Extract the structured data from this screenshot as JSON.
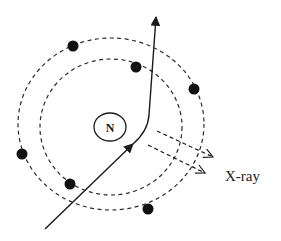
{
  "diagram": {
    "nucleus": {
      "label": "N",
      "cx": 110,
      "cy": 127,
      "rx": 16,
      "ry": 14
    },
    "orbits": [
      {
        "name": "inner-orbit",
        "cx": 111,
        "cy": 127,
        "rx": 71,
        "ry": 68
      },
      {
        "name": "outer-orbit",
        "cx": 111,
        "cy": 124,
        "rx": 93,
        "ry": 86
      }
    ],
    "electrons": [
      {
        "x": 73,
        "y": 46
      },
      {
        "x": 136,
        "y": 67
      },
      {
        "x": 194,
        "y": 89
      },
      {
        "x": 22,
        "y": 154
      },
      {
        "x": 70,
        "y": 184
      },
      {
        "x": 148,
        "y": 209
      }
    ],
    "incident_particle_path": "M 45 229 L 135 142 Q 148 130 149 115 L 156 15",
    "xray_label": "X-ray",
    "xray_arrows": [
      {
        "x1": 157,
        "y1": 131,
        "x2": 213,
        "y2": 157
      },
      {
        "x1": 148,
        "y1": 145,
        "x2": 205,
        "y2": 173
      }
    ]
  }
}
